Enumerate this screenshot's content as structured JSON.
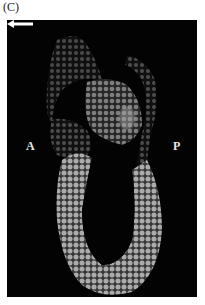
{
  "figure": {
    "panel_label": "(C)",
    "image_description": "Fluorescence microscopy of embryonic tissue section on black background, nuclei stained gray-white",
    "labels": {
      "anterior": "A",
      "posterior": "P"
    },
    "annotations": [
      {
        "type": "arrow",
        "direction": "left",
        "color": "#ffffff"
      }
    ],
    "colors": {
      "background": "#030303",
      "tissue": "#9a9a9a",
      "label": "#e8e8e8"
    }
  }
}
